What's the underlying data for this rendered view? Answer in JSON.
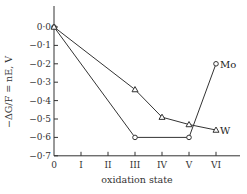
{
  "chart_data": {
    "type": "line",
    "title": "",
    "xlabel": "oxidation state",
    "ylabel": "−ΔG/F = nE, V",
    "categories": [
      "0",
      "I",
      "II",
      "III",
      "IV",
      "V",
      "VI"
    ],
    "x": [
      0,
      1,
      2,
      3,
      4,
      5,
      6
    ],
    "ylim": [
      -0.7,
      0.0
    ],
    "yticks": [
      0.0,
      -0.1,
      -0.2,
      -0.3,
      -0.4,
      -0.5,
      -0.6,
      -0.7
    ],
    "ytick_labels": [
      "0·0",
      "−0·1",
      "−0·2",
      "−0·3",
      "−0·4",
      "−0·5",
      "−0·6",
      "−0·7"
    ],
    "grid": false,
    "legend": "inline labels at end of series",
    "series": [
      {
        "name": "Mo",
        "marker": "circle",
        "points": [
          {
            "x": 0,
            "y": 0.0
          },
          {
            "x": 3,
            "y": -0.6
          },
          {
            "x": 5,
            "y": -0.6
          },
          {
            "x": 6,
            "y": -0.2
          }
        ]
      },
      {
        "name": "W",
        "marker": "triangle",
        "points": [
          {
            "x": 0,
            "y": 0.0
          },
          {
            "x": 3,
            "y": -0.34
          },
          {
            "x": 4,
            "y": -0.49
          },
          {
            "x": 5,
            "y": -0.53
          },
          {
            "x": 6,
            "y": -0.56
          }
        ]
      }
    ]
  }
}
